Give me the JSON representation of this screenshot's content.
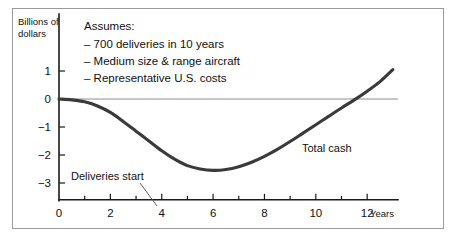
{
  "chart_data": {
    "type": "line",
    "title": "",
    "xlabel": "Years",
    "ylabel": "Billions of dollars",
    "xlim": [
      0,
      13.2
    ],
    "ylim": [
      -3.6,
      1.6
    ],
    "grid": false,
    "legend_position": "inline-annotation",
    "x_ticks_major": [
      0,
      2,
      4,
      6,
      8,
      10,
      12
    ],
    "x_ticks_minor": [
      1,
      3,
      5,
      7,
      9,
      11
    ],
    "x_tick_labels": [
      "0",
      "2",
      "4",
      "6",
      "8",
      "10",
      "12"
    ],
    "y_ticks": [
      1,
      0,
      -1,
      -2,
      -3
    ],
    "y_tick_labels": [
      "1",
      "0",
      "−1",
      "−2",
      "−3"
    ],
    "zero_reference_line": 0,
    "series": [
      {
        "name": "Total cash",
        "x": [
          0,
          0.5,
          1,
          1.5,
          2,
          2.5,
          3,
          3.5,
          4,
          4.5,
          5,
          5.5,
          6,
          6.5,
          7,
          7.5,
          8,
          8.5,
          9,
          9.5,
          10,
          10.5,
          11,
          11.5,
          12,
          12.5,
          13
        ],
        "values": [
          0,
          -0.03,
          -0.1,
          -0.25,
          -0.48,
          -0.8,
          -1.15,
          -1.5,
          -1.85,
          -2.15,
          -2.38,
          -2.5,
          -2.55,
          -2.52,
          -2.42,
          -2.26,
          -2.05,
          -1.8,
          -1.52,
          -1.22,
          -0.92,
          -0.62,
          -0.32,
          -0.03,
          0.28,
          0.62,
          1.05
        ]
      }
    ],
    "annotations": [
      {
        "id": "assumptions-note",
        "heading": "Assumes:",
        "items": [
          "– 700 deliveries in 10 years",
          "– Medium size & range aircraft",
          "– Representative U.S. costs"
        ]
      },
      {
        "id": "deliveries-start-callout",
        "text": "Deliveries start",
        "points_to_x": 4
      },
      {
        "id": "series-inline-label",
        "text": "Total cash"
      }
    ],
    "colors": {
      "curve": "#3a3a3a",
      "axis": "#1a1a1a",
      "zero_line": "#8e8e8e",
      "frame": "#9a9a9a",
      "text": "#111111",
      "background": "#ffffff"
    }
  },
  "axis_title_lines": {
    "line1": "Billions of",
    "line2": "dollars"
  }
}
